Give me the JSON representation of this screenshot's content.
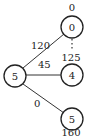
{
  "nodes": {
    "top": {
      "label": "0",
      "value": "0"
    },
    "root": {
      "label": "5"
    },
    "middle": {
      "label": "4",
      "value": "125"
    },
    "bottom": {
      "label": "5",
      "value": "160"
    }
  },
  "edges": {
    "root_top": {
      "weight": "120"
    },
    "root_middle": {
      "weight": "45"
    },
    "root_bottom": {
      "weight": "0"
    }
  },
  "colors": {
    "stroke": "#222222",
    "background": "#ffffff"
  }
}
